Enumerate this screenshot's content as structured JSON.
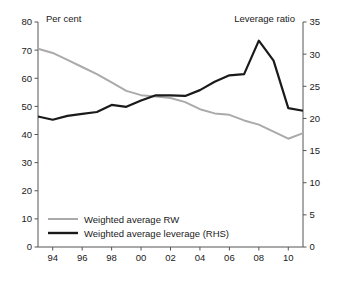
{
  "chart_data": {
    "type": "line",
    "title": "",
    "xlabel": "",
    "ylabel": "Per cent",
    "y2label": "Leverage ratio",
    "grid": false,
    "legend_position": "inside-bottom-left",
    "x": [
      1993,
      1994,
      1995,
      1996,
      1997,
      1998,
      1999,
      2000,
      2001,
      2002,
      2003,
      2004,
      2005,
      2006,
      2007,
      2008,
      2009,
      2010,
      2011
    ],
    "xtick_values": [
      1994,
      1996,
      1998,
      2000,
      2002,
      2004,
      2006,
      2008,
      2010
    ],
    "xtick_labels": [
      "94",
      "96",
      "98",
      "00",
      "02",
      "04",
      "06",
      "08",
      "10"
    ],
    "xlim": [
      1993,
      2011
    ],
    "ylim": [
      0,
      80
    ],
    "ytick_labels": [
      "0",
      "10",
      "20",
      "30",
      "40",
      "50",
      "60",
      "70",
      "80"
    ],
    "ytick_values": [
      0,
      10,
      20,
      30,
      40,
      50,
      60,
      70,
      80
    ],
    "y2lim": [
      0,
      35
    ],
    "y2tick_labels": [
      "0",
      "5",
      "10",
      "15",
      "20",
      "25",
      "30",
      "35"
    ],
    "y2tick_values": [
      0,
      5,
      10,
      15,
      20,
      25,
      30,
      35
    ],
    "series": [
      {
        "name": "Weighted average RW",
        "axis": "left",
        "color": "#aaaaaa",
        "width": 2.0,
        "values": [
          70.5,
          69.0,
          66.5,
          64.0,
          61.5,
          58.5,
          55.5,
          54.0,
          53.5,
          53.0,
          51.5,
          49.0,
          47.5,
          47.0,
          45.0,
          43.5,
          41.0,
          38.5,
          40.5
        ]
      },
      {
        "name": "Weighted average leverage (RHS)",
        "axis": "right",
        "color": "#1a1a1a",
        "width": 2.2,
        "values": [
          20.3,
          19.8,
          20.4,
          20.7,
          21.0,
          22.1,
          21.8,
          22.8,
          23.6,
          23.6,
          23.5,
          24.4,
          25.7,
          26.7,
          26.9,
          32.1,
          29.0,
          21.6,
          21.2
        ]
      }
    ]
  },
  "labels": {
    "left_axis_title": "Per cent",
    "right_axis_title": "Leverage ratio"
  },
  "legend": {
    "items": [
      {
        "label": "Weighted average RW",
        "color": "#aaaaaa"
      },
      {
        "label": "Weighted average leverage (RHS)",
        "color": "#1a1a1a"
      }
    ]
  }
}
